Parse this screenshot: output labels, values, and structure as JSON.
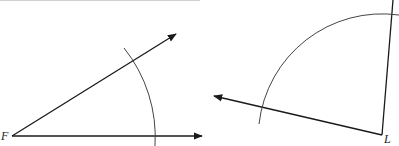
{
  "figure": {
    "left_angle": {
      "vertex_label": "F",
      "vertex": [
        12,
        136
      ],
      "ray_upper_end": [
        176,
        34
      ],
      "ray_lower_end": [
        202,
        136
      ],
      "arc": {
        "center": [
          12,
          136
        ],
        "start": [
          124,
          48
        ],
        "end": [
          155,
          146
        ]
      }
    },
    "right_angle": {
      "vertex_label": "L",
      "vertex": [
        382,
        135
      ],
      "ray_left_end": [
        214,
        96
      ],
      "ray_up_end": [
        393,
        0
      ],
      "arc": {
        "center": [
          382,
          135
        ],
        "start": [
          259,
          124
        ],
        "end": [
          399,
          15
        ]
      }
    },
    "top_border_line": {
      "x1": 0,
      "x2": 200,
      "y": 0
    }
  },
  "colors": {
    "stroke": "#1a1a1a",
    "arc": "#444444",
    "background": "#ffffff"
  }
}
